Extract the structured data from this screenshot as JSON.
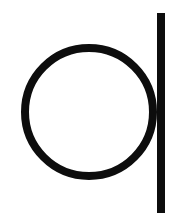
{
  "canvas": {
    "width": 173,
    "height": 222,
    "background_color": "#ffffff",
    "title": "Glyph"
  },
  "artwork": {
    "name": "d-glyph",
    "description": "Black circle outline with a vertical stem bar on its right side",
    "ink_color": "#0d0d0d",
    "shapes": [
      {
        "id": "bowl",
        "type": "circle-outline",
        "cx": 89,
        "cy": 112,
        "r": 64,
        "stroke_width": 8,
        "stroke_color": "#0d0d0d",
        "fill": "none"
      },
      {
        "id": "stem",
        "type": "vertical-bar",
        "x": 157,
        "y_top": 13,
        "y_bottom": 213,
        "width": 8,
        "fill_color": "#0d0d0d"
      }
    ]
  }
}
